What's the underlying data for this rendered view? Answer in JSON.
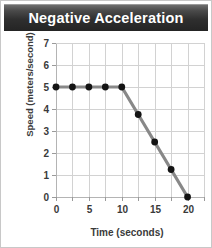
{
  "title": "Negative Acceleration",
  "chart_data": {
    "type": "line",
    "title": "Negative Acceleration",
    "xlabel": "Time (seconds)",
    "ylabel": "Speed (meters/second)",
    "xlim": [
      0,
      22.5
    ],
    "ylim": [
      0,
      7
    ],
    "xticks": [
      0,
      2.5,
      5,
      7.5,
      10,
      12.5,
      15,
      17.5,
      20,
      22.5
    ],
    "xtick_labels": [
      "0",
      "",
      "5",
      "",
      "10",
      "",
      "15",
      "",
      "20",
      ""
    ],
    "yticks": [
      0,
      1,
      2,
      3,
      4,
      5,
      6,
      7
    ],
    "ytick_labels": [
      "0",
      "1",
      "2",
      "3",
      "4",
      "5",
      "6",
      "7"
    ],
    "grid": true,
    "legend": false,
    "line_color": "#888888",
    "marker_color": "#141414",
    "series": [
      {
        "name": "Speed",
        "x": [
          0,
          2.5,
          5,
          7.5,
          10,
          12.5,
          15,
          17.5,
          20
        ],
        "values": [
          5,
          5,
          5,
          5,
          5,
          3.75,
          2.5,
          1.25,
          0
        ]
      }
    ]
  }
}
